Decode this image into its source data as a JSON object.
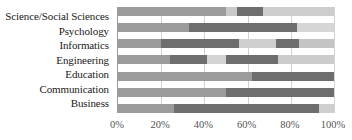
{
  "chart_data": {
    "type": "bar",
    "orientation": "horizontal",
    "stacked": true,
    "normalized_percent": true,
    "title": "",
    "subtitle": "",
    "xlabel": "",
    "ylabel": "",
    "xlim": [
      0,
      100
    ],
    "xticks": [
      0,
      20,
      40,
      60,
      80,
      100
    ],
    "xticklabels": [
      "0%",
      "20%",
      "40%",
      "60%",
      "80%",
      "100%"
    ],
    "grid": true,
    "grid_axis": "x",
    "legend": "none",
    "categories": [
      "Science/Social Sciences",
      "Psychology",
      "Informatics",
      "Engineering",
      "Education",
      "Communication",
      "Business"
    ],
    "colors": {
      "mid_gray": "#9b9b9b",
      "dark_gray": "#6e6e6e",
      "light_gray": "#c9c9c9",
      "pale_gray": "#dedede",
      "gridline": "#d2d2d2",
      "axis": "#9a9a9a",
      "label_text": "#1a1a1a",
      "tick_text": "#555555"
    },
    "rows": [
      {
        "category": "Science/Social Sciences",
        "segments": [
          {
            "value": 50,
            "color": "#9b9b9b"
          },
          {
            "value": 5,
            "color": "#c9c9c9"
          },
          {
            "value": 12,
            "color": "#6e6e6e"
          },
          {
            "value": 33,
            "color": "#cdcdcd"
          }
        ]
      },
      {
        "category": "Psychology",
        "segments": [
          {
            "value": 33,
            "color": "#9b9b9b"
          },
          {
            "value": 50,
            "color": "#6e6e6e"
          },
          {
            "value": 17,
            "color": "#d6d6d6"
          }
        ]
      },
      {
        "category": "Informatics",
        "segments": [
          {
            "value": 20,
            "color": "#9b9b9b"
          },
          {
            "value": 36,
            "color": "#6e6e6e"
          },
          {
            "value": 17,
            "color": "#cfcfcf"
          },
          {
            "value": 11,
            "color": "#6e6e6e"
          },
          {
            "value": 16,
            "color": "#c4c4c4"
          }
        ]
      },
      {
        "category": "Engineering",
        "segments": [
          {
            "value": 24,
            "color": "#9b9b9b"
          },
          {
            "value": 17,
            "color": "#6e6e6e"
          },
          {
            "value": 9,
            "color": "#d4d4d4"
          },
          {
            "value": 24,
            "color": "#6e6e6e"
          },
          {
            "value": 26,
            "color": "#cccccc"
          }
        ]
      },
      {
        "category": "Education",
        "segments": [
          {
            "value": 62,
            "color": "#9b9b9b"
          },
          {
            "value": 38,
            "color": "#6e6e6e"
          }
        ]
      },
      {
        "category": "Communication",
        "segments": [
          {
            "value": 50,
            "color": "#9b9b9b"
          },
          {
            "value": 50,
            "color": "#6e6e6e"
          }
        ]
      },
      {
        "category": "Business",
        "segments": [
          {
            "value": 26,
            "color": "#9b9b9b"
          },
          {
            "value": 67,
            "color": "#6e6e6e"
          },
          {
            "value": 7,
            "color": "#cfcfcf"
          }
        ]
      }
    ]
  }
}
